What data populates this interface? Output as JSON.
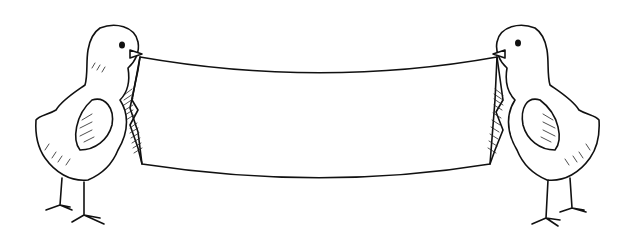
{
  "illustration": {
    "subject": "Two baby chicks holding a blank banner in their beaks",
    "style": "black line-art on white",
    "colors": {
      "ink": "#111111",
      "background": "#ffffff"
    },
    "banner": {
      "text": ""
    },
    "characters": [
      {
        "name": "left-chick",
        "facing": "right"
      },
      {
        "name": "right-chick",
        "facing": "left"
      }
    ]
  }
}
